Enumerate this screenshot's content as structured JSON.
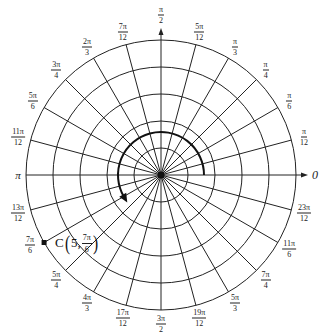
{
  "diagram": {
    "type": "polar-grid",
    "center": {
      "x": 161,
      "y": 175
    },
    "ring_count": 5,
    "ring_spacing_px": 27,
    "ray_step": "π/12",
    "colors": {
      "grid": "#222222",
      "background": "#ffffff",
      "arc": "#111111"
    }
  },
  "angle_labels": [
    {
      "id": "0",
      "text": "0",
      "single": true
    },
    {
      "id": "pi_12",
      "num": "π",
      "den": "12"
    },
    {
      "id": "pi_6",
      "num": "π",
      "den": "6"
    },
    {
      "id": "pi_4",
      "num": "π",
      "den": "4"
    },
    {
      "id": "pi_3",
      "num": "π",
      "den": "3"
    },
    {
      "id": "5pi_12",
      "num": "5π",
      "den": "12"
    },
    {
      "id": "pi_2",
      "num": "π",
      "den": "2"
    },
    {
      "id": "7pi_12",
      "num": "7π",
      "den": "12"
    },
    {
      "id": "2pi_3",
      "num": "2π",
      "den": "3"
    },
    {
      "id": "3pi_4",
      "num": "3π",
      "den": "4"
    },
    {
      "id": "5pi_6",
      "num": "5π",
      "den": "6"
    },
    {
      "id": "11pi_12",
      "num": "11π",
      "den": "12"
    },
    {
      "id": "pi",
      "text": "π",
      "single": true
    },
    {
      "id": "13pi_12",
      "num": "13π",
      "den": "12"
    },
    {
      "id": "7pi_6",
      "num": "7π",
      "den": "6"
    },
    {
      "id": "5pi_4",
      "num": "5π",
      "den": "4"
    },
    {
      "id": "4pi_3",
      "num": "4π",
      "den": "3"
    },
    {
      "id": "17pi_12",
      "num": "17π",
      "den": "12"
    },
    {
      "id": "3pi_2",
      "num": "3π",
      "den": "2"
    },
    {
      "id": "19pi_12",
      "num": "19π",
      "den": "12"
    },
    {
      "id": "5pi_3",
      "num": "5π",
      "den": "3"
    },
    {
      "id": "7pi_4",
      "num": "7π",
      "den": "4"
    },
    {
      "id": "11pi_6",
      "num": "11π",
      "den": "6"
    },
    {
      "id": "23pi_12",
      "num": "23π",
      "den": "12"
    }
  ],
  "point": {
    "name": "C",
    "r": "5",
    "theta_num": "7π",
    "theta_den": "6",
    "open_paren": "(",
    "close_paren": ")",
    "comma": ","
  },
  "rotation_arc": {
    "start_angle": "0",
    "end_angle": "7π/6",
    "direction": "counterclockwise"
  }
}
